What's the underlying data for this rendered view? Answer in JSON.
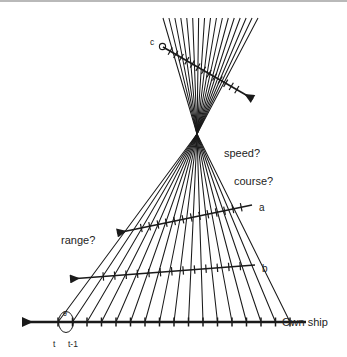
{
  "figure": {
    "background": "#ffffff",
    "ink": "#1a1a1a",
    "text_color": "#232323",
    "top_rule_color": "#b9b9b9"
  },
  "labels": {
    "own_ship": "Own ship",
    "speed": "speed?",
    "course": "course?",
    "range": "range?",
    "line_a": "a",
    "line_b": "b",
    "line_c": "c",
    "time_t": "t",
    "time_t_minus_1": "t-1",
    "theta": "θ"
  },
  "chart_data": {
    "type": "diagram",
    "axes": {
      "own_ship_track": {
        "label": "Own ship",
        "x_start": 306,
        "x_end": 22,
        "y": 322,
        "arrow_end": "left",
        "tick_count": 17,
        "tick_height": 9,
        "first_tick_x": 58,
        "last_tick_x": 290,
        "annotations": [
          {
            "text": "t",
            "x": 56,
            "y": 344
          },
          {
            "text": "t-1",
            "x": 72,
            "y": 344
          },
          {
            "text": "θ",
            "x": 66,
            "y": 315
          }
        ]
      }
    },
    "bearing_fan": {
      "count": 17,
      "waist_x": 197,
      "waist_y": 134,
      "base_y": 322,
      "base_x_first": 58,
      "base_x_last": 290,
      "top_y": 18,
      "top_x_first": 163,
      "top_x_last": 258
    },
    "candidate_tracks": [
      {
        "name": "a",
        "label": "a",
        "label_x": 259,
        "label_y": 207,
        "x1": 252,
        "y1": 205,
        "x2": 117,
        "y2": 233,
        "arrow_end": "left",
        "ticks": 13
      },
      {
        "name": "b",
        "label": "b",
        "label_x": 262,
        "label_y": 269,
        "x1": 255,
        "y1": 265,
        "x2": 70,
        "y2": 279,
        "arrow_end": "left",
        "ticks": 13
      },
      {
        "name": "c",
        "label": "c",
        "label_x": 155,
        "label_y": 45,
        "x1": 163,
        "y1": 47,
        "x2": 253,
        "y2": 99,
        "arrow_end": "right",
        "ticks": 13,
        "origin_marker": "small-circle"
      }
    ],
    "questions": [
      {
        "text": "speed?",
        "x": 224,
        "y": 153
      },
      {
        "text": "course?",
        "x": 234,
        "y": 181
      },
      {
        "text": "range?",
        "x": 61,
        "y": 240
      }
    ]
  }
}
